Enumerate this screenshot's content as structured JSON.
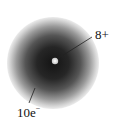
{
  "diagram": {
    "type": "atom-electron-cloud",
    "nucleus_label": "8+",
    "electron_label_count": "10e",
    "electron_label_sup": "−",
    "colors": {
      "cloud_core": "#1a1a1a",
      "cloud_mid": "#5a5a5a",
      "cloud_edge": "#e2e2e2",
      "nucleus": "#f2f2f2",
      "leader_line": "#222222"
    }
  }
}
